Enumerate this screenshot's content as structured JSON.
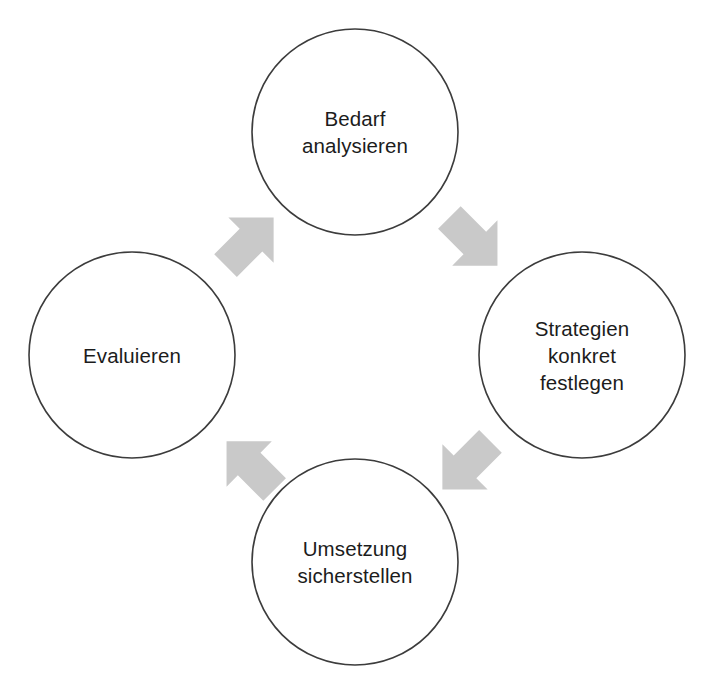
{
  "diagram": {
    "type": "cycle-diagram",
    "language": "de",
    "background_color": "#ffffff",
    "canvas": {
      "width": 714,
      "height": 689
    },
    "style": {
      "circle_fill": "#ffffff",
      "circle_stroke": "#3c3c3c",
      "circle_stroke_width": 1.6,
      "arrow_fill": "#c9c9c9",
      "text_color": "#1c1c1c",
      "font_size_px": 20.5
    },
    "nodes": [
      {
        "id": "bedarf-analysieren",
        "position": "top",
        "cx": 355,
        "cy": 132,
        "r": 103,
        "lines": [
          "Bedarf",
          "analysieren"
        ],
        "text": "Bedarf analysieren",
        "order": 1
      },
      {
        "id": "strategien-konkret-festlegen",
        "position": "right",
        "cx": 582,
        "cy": 355,
        "r": 103,
        "lines": [
          "Strategien",
          "konkret",
          "festlegen"
        ],
        "text": "Strategien konkret festlegen",
        "order": 2
      },
      {
        "id": "umsetzung-sicherstellen",
        "position": "bottom",
        "cx": 355,
        "cy": 562,
        "r": 103,
        "lines": [
          "Umsetzung",
          "sicherstellen"
        ],
        "text": "Umsetzung sicherstellen",
        "order": 3
      },
      {
        "id": "evaluieren",
        "position": "left",
        "cx": 132,
        "cy": 355,
        "r": 103,
        "lines": [
          "Evaluieren"
        ],
        "text": "Evaluieren",
        "order": 4
      }
    ],
    "arrows": [
      {
        "id": "arrow-evaluieren-to-bedarf",
        "from": "evaluieren",
        "to": "bedarf-analysieren",
        "position": "top-left",
        "cx": 251,
        "cy": 243,
        "direction": "up-right",
        "rotation_deg": -45
      },
      {
        "id": "arrow-bedarf-to-strategien",
        "from": "bedarf-analysieren",
        "to": "strategien-konkret-festlegen",
        "position": "top-right",
        "cx": 472,
        "cy": 243,
        "direction": "down-right",
        "rotation_deg": 45
      },
      {
        "id": "arrow-strategien-to-umsetzung",
        "from": "strategien-konkret-festlegen",
        "to": "umsetzung-sicherstellen",
        "position": "bottom-right",
        "cx": 465,
        "cy": 464,
        "direction": "down-left",
        "rotation_deg": 135
      },
      {
        "id": "arrow-umsetzung-to-evaluieren",
        "from": "umsetzung-sicherstellen",
        "to": "evaluieren",
        "position": "bottom-left",
        "cx": 252,
        "cy": 464,
        "direction": "up-left",
        "rotation_deg": -135
      }
    ]
  }
}
